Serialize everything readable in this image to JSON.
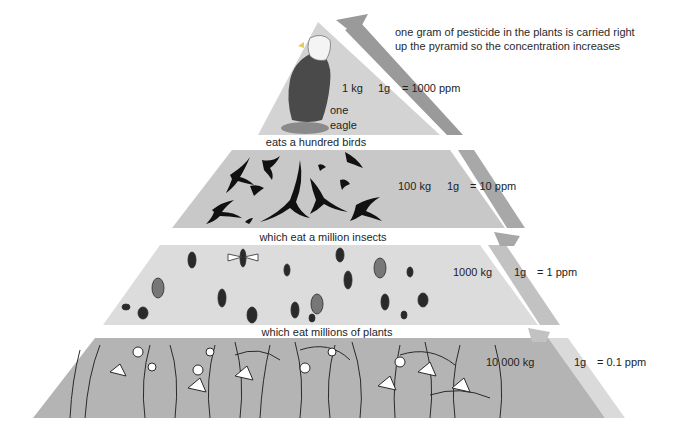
{
  "caption": {
    "line1": "one gram of pesticide in the plants is carried right",
    "line2": "up the pyramid so the concentration increases"
  },
  "tiers": [
    {
      "name": "eagle",
      "subject_line1": "one",
      "subject_line2": "eagle",
      "mass": "1 kg",
      "pesticide": "1g",
      "concentration": "= 1000 ppm",
      "fill": "#d3d3d3"
    },
    {
      "name": "birds",
      "connector": "eats a hundred birds",
      "mass": "100 kg",
      "pesticide": "1g",
      "concentration": "= 10 ppm",
      "fill": "#c8c8c8"
    },
    {
      "name": "insects",
      "connector": "which eat a million insects",
      "mass": "1000 kg",
      "pesticide": "1g",
      "concentration": "= 1 ppm",
      "fill": "#dcdcdc"
    },
    {
      "name": "plants",
      "connector": "which eat millions of plants",
      "mass": "10 000 kg",
      "pesticide": "1g",
      "concentration": "= 0.1 ppm",
      "fill": "#b4b4b4"
    }
  ],
  "arrow": {
    "colors": [
      "#9a9a9a",
      "#a8a8a8",
      "#c2c2c2",
      "#dadada"
    ],
    "direction": "up"
  }
}
